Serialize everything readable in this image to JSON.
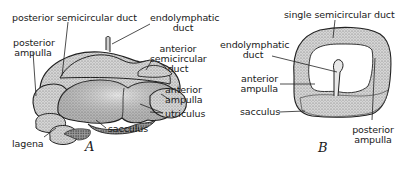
{
  "figure": {
    "panels": [
      {
        "id": "A",
        "letter": "A",
        "labels": {
          "posterior_semicircular_duct": "posterior semicircular duct",
          "posterior_ampulla_1": "posterior",
          "posterior_ampulla_2": "ampulla",
          "endolymphatic_duct_1": "endolymphatic",
          "endolymphatic_duct_2": "duct",
          "anterior_semicircular_duct_1": "anterior",
          "anterior_semicircular_duct_2": "semicircular",
          "anterior_semicircular_duct_3": "duct",
          "anterior_ampulla_1": "anterior",
          "anterior_ampulla_2": "ampulla",
          "utriculus": "utriculus",
          "sacculus": "sacculus",
          "lagena": "lagena"
        }
      },
      {
        "id": "B",
        "letter": "B",
        "labels": {
          "single_semicircular_duct": "single semicircular duct",
          "endolymphatic_duct_1": "endolymphatic",
          "endolymphatic_duct_2": "duct",
          "anterior_ampulla_1": "anterior",
          "anterior_ampulla_2": "ampulla",
          "sacculus": "sacculus",
          "posterior_ampulla_1": "posterior",
          "posterior_ampulla_2": "ampulla"
        }
      }
    ],
    "colors": {
      "ink": "#1a1a1a",
      "fill_light": "#d9d9d9",
      "fill_mid": "#bdbdbd",
      "fill_dark": "#8a8a8a",
      "background": "#ffffff"
    }
  }
}
